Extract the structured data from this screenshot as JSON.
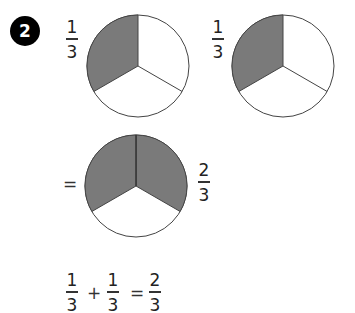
{
  "exercise": {
    "number": "2"
  },
  "colors": {
    "shaded": "#7a7a7a",
    "unshaded": "#ffffff",
    "outline": "#444444",
    "badge_bg": "#000000",
    "badge_fg": "#ffffff"
  },
  "pies": [
    {
      "label_numerator": "1",
      "label_denominator": "3",
      "slices_total": 3,
      "slices_shaded": 1
    },
    {
      "label_numerator": "1",
      "label_denominator": "3",
      "slices_total": 3,
      "slices_shaded": 1
    },
    {
      "label_numerator": "2",
      "label_denominator": "3",
      "slices_total": 3,
      "slices_shaded": 2
    }
  ],
  "equals_sign": "=",
  "equation": {
    "term1": {
      "numerator": "1",
      "denominator": "3"
    },
    "plus": "+",
    "term2": {
      "numerator": "1",
      "denominator": "3"
    },
    "equals": "=",
    "result": {
      "numerator": "2",
      "denominator": "3"
    }
  }
}
